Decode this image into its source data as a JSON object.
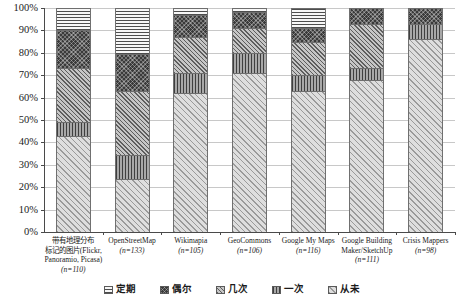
{
  "chart_data": {
    "type": "bar",
    "subtype": "stacked-percentage-column",
    "title": "",
    "xlabel": "",
    "ylabel": "",
    "ylim": [
      0,
      100
    ],
    "ytick_labels": [
      "100%",
      "90%",
      "80%",
      "70%",
      "60%",
      "50%",
      "40%",
      "30%",
      "20%",
      "10%",
      "0%"
    ],
    "ytick_values": [
      100,
      90,
      80,
      70,
      60,
      50,
      40,
      30,
      20,
      10,
      0
    ],
    "grid": true,
    "legend_position": "bottom",
    "categories": [
      "带有地理分布标记的图片(Flickr, Panoramio, Picasa)",
      "OpenStreetMap",
      "Wikimapia",
      "GeoCommons",
      "Google My Maps",
      "Google Building Maker/SketchUp",
      "Crisis Mappers"
    ],
    "category_labels": [
      {
        "lines": [
          "带有地理分布",
          "标记的图片(Flickr,",
          "Panoramio, Picasa)"
        ],
        "n": "(n=110)"
      },
      {
        "lines": [
          "OpenStreetMap"
        ],
        "n": "(n=133)"
      },
      {
        "lines": [
          "Wikimapia"
        ],
        "n": "(n=105)"
      },
      {
        "lines": [
          "GeoCommons"
        ],
        "n": "(n=106)"
      },
      {
        "lines": [
          "Google My Maps"
        ],
        "n": "(n=116)"
      },
      {
        "lines": [
          "Google Building",
          "Maker/SketchUp"
        ],
        "n": "(n=111)"
      },
      {
        "lines": [
          "Crisis Mappers"
        ],
        "n": "(n=98)"
      }
    ],
    "series": [
      {
        "name": "定期",
        "pattern": "horizontal-lines",
        "values": [
          10,
          20.5,
          3,
          2,
          9,
          0,
          0
        ]
      },
      {
        "name": "偶尔",
        "pattern": "dark-crosshatch",
        "values": [
          17,
          16.5,
          10,
          7,
          6,
          7,
          7
        ]
      },
      {
        "name": "几次",
        "pattern": "dense-diagonal",
        "values": [
          24,
          28.5,
          16,
          11,
          15,
          20,
          0
        ]
      },
      {
        "name": "一次",
        "pattern": "vertical-lines",
        "values": [
          6,
          11,
          9,
          9,
          7,
          5,
          7
        ]
      },
      {
        "name": "从未",
        "pattern": "light-diagonal",
        "values": [
          43,
          23.5,
          62,
          71,
          63,
          68,
          86
        ]
      }
    ],
    "stack_order_bottom_to_top": [
      "从未",
      "一次",
      "几次",
      "偶尔",
      "定期"
    ]
  },
  "legend": {
    "items": [
      {
        "label": "定期",
        "swatch": "horizontal-lines-swatch"
      },
      {
        "label": "偶尔",
        "swatch": "dark-crosshatch-swatch"
      },
      {
        "label": "几次",
        "swatch": "dense-diagonal-swatch"
      },
      {
        "label": "一次",
        "swatch": "vertical-lines-swatch"
      },
      {
        "label": "从未",
        "swatch": "light-diagonal-swatch"
      }
    ]
  },
  "colors": {
    "dingqi": "#4d4d4d",
    "ouer": "#3a3a3a",
    "jici": "#5e5e5e",
    "yici": "#3f3f3f",
    "congwei": "#9a9a9a",
    "grid": "#c8c8c8",
    "axis": "#4a4a4a",
    "text": "#1a1a1a",
    "background": "#ffffff"
  }
}
